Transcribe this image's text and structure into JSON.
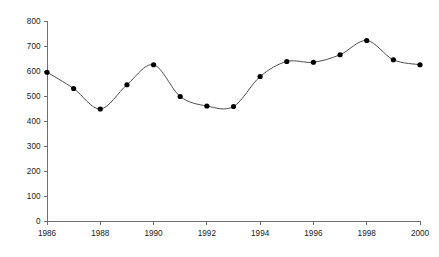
{
  "chart_data": {
    "type": "line",
    "title": "",
    "subtitle": "",
    "xlabel": "",
    "ylabel": "",
    "x": [
      1986,
      1987,
      1988,
      1989,
      1990,
      1991,
      1992,
      1993,
      1994,
      1995,
      1996,
      1997,
      1998,
      1999,
      2000
    ],
    "values": [
      595,
      530,
      448,
      545,
      625,
      498,
      460,
      458,
      578,
      638,
      635,
      665,
      722,
      645,
      625
    ],
    "series": [
      {
        "name": "series-1",
        "values": [
          595,
          530,
          448,
          545,
          625,
          498,
          460,
          458,
          578,
          638,
          635,
          665,
          722,
          645,
          625
        ]
      }
    ],
    "xlim": [
      1986,
      2000
    ],
    "ylim": [
      0,
      800
    ],
    "x_tick_labels": [
      "1986",
      "1988",
      "1990",
      "1992",
      "1994",
      "1996",
      "1998",
      "2000"
    ],
    "x_tick_values": [
      1986,
      1988,
      1990,
      1992,
      1994,
      1996,
      1998,
      2000
    ],
    "x_minor_tick_values": [
      1987,
      1989,
      1991,
      1993,
      1995,
      1997,
      1999
    ],
    "y_tick_labels": [
      "0",
      "100",
      "200",
      "300",
      "400",
      "500",
      "600",
      "700",
      "800"
    ],
    "y_tick_values": [
      0,
      100,
      200,
      300,
      400,
      500,
      600,
      700,
      800
    ],
    "grid": false,
    "legend": false,
    "legend_position": "none",
    "interpolation": "smooth",
    "marker": "circle",
    "colors": {
      "line": "#4d4d4d",
      "marker": "#000000",
      "axis": "#6e6e6e",
      "tick_label": "#1a1a1a",
      "background": "#ffffff"
    }
  }
}
